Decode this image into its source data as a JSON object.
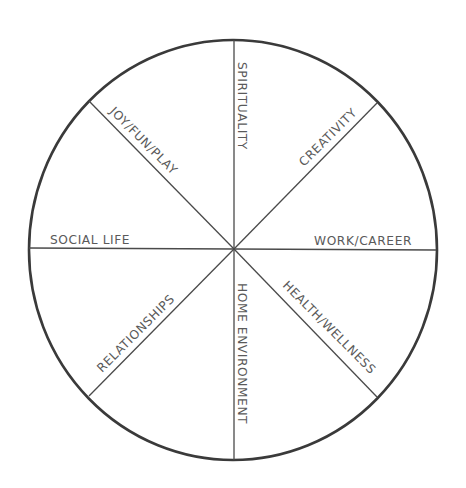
{
  "diagram": {
    "type": "wheel-of-life",
    "center": {
      "x": 234,
      "y": 249
    },
    "radius": {
      "rx": 204,
      "ry": 210
    },
    "colors": {
      "outline": "#3a3a3a",
      "spokes": "#4a4a4a",
      "label": "#5a5a5a",
      "background": "#ffffff"
    },
    "segments": [
      {
        "id": "spirituality",
        "label": "SPIRITUALITY"
      },
      {
        "id": "creativity",
        "label": "CREATIVITY"
      },
      {
        "id": "work-career",
        "label": "WORK/CAREER"
      },
      {
        "id": "health-wellness",
        "label": "HEALTH/WELLNESS"
      },
      {
        "id": "home-environment",
        "label": "HOME ENVIRONMENT"
      },
      {
        "id": "relationships",
        "label": "RELATIONSHIPS"
      },
      {
        "id": "social-life",
        "label": "SOCIAL LIFE"
      },
      {
        "id": "joy-fun-play",
        "label": "JOY/FUN/PLAY"
      }
    ]
  }
}
